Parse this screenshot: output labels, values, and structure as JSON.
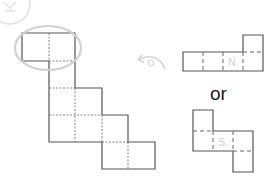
{
  "diagram": {
    "connector_text": "or",
    "alternative_a": {
      "face_label": "N."
    },
    "alternative_b": {
      "face_label": "S."
    },
    "icons": {
      "hint": "lightbulb-icon",
      "rotate": "rotate-arrow-icon"
    },
    "colors": {
      "line": "#555555",
      "highlight": "#d0d0d0",
      "faint": "#cfcfcf",
      "text": "#1a1a1a"
    }
  }
}
